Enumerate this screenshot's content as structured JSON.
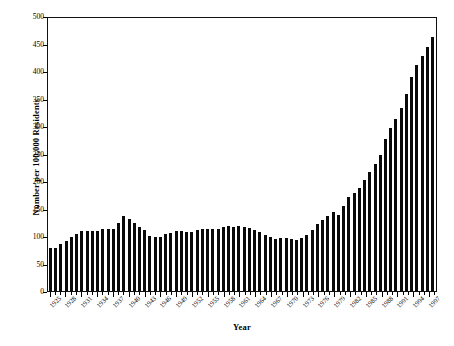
{
  "chart_data": {
    "type": "bar",
    "title": "",
    "xlabel": "Year",
    "ylabel": "Number per 100,000 Residents",
    "ylim": [
      0,
      500
    ],
    "ytick_step": 50,
    "yticks": [
      0,
      50,
      100,
      150,
      200,
      250,
      300,
      350,
      400,
      450,
      500
    ],
    "grid": false,
    "legend": "none",
    "bar_color": "#0a0a0a",
    "xtick_label_rotation": -45,
    "xtick_label_interval": 3,
    "xtick_labels": [
      "1925",
      "1928",
      "1931",
      "1934",
      "1937",
      "1940",
      "1943",
      "1946",
      "1949",
      "1952",
      "1955",
      "1958",
      "1961",
      "1964",
      "1967",
      "1970",
      "1973",
      "1976",
      "1979",
      "1982",
      "1985",
      "1988",
      "1991",
      "1994",
      "1997"
    ],
    "categories": [
      "1925",
      "1926",
      "1927",
      "1928",
      "1929",
      "1930",
      "1931",
      "1932",
      "1933",
      "1934",
      "1935",
      "1936",
      "1937",
      "1938",
      "1939",
      "1940",
      "1941",
      "1942",
      "1943",
      "1944",
      "1945",
      "1946",
      "1947",
      "1948",
      "1949",
      "1950",
      "1951",
      "1952",
      "1953",
      "1954",
      "1955",
      "1956",
      "1957",
      "1958",
      "1959",
      "1960",
      "1961",
      "1962",
      "1963",
      "1964",
      "1965",
      "1966",
      "1967",
      "1968",
      "1969",
      "1970",
      "1971",
      "1972",
      "1973",
      "1974",
      "1975",
      "1976",
      "1977",
      "1978",
      "1979",
      "1980",
      "1981",
      "1982",
      "1983",
      "1984",
      "1985",
      "1986",
      "1987",
      "1988",
      "1989",
      "1990",
      "1991",
      "1992",
      "1993",
      "1994",
      "1995",
      "1996",
      "1997",
      "1998"
    ],
    "values": [
      79,
      79,
      85,
      91,
      98,
      104,
      110,
      110,
      109,
      109,
      113,
      113,
      113,
      123,
      137,
      131,
      124,
      117,
      111,
      100,
      98,
      99,
      103,
      106,
      109,
      109,
      107,
      107,
      111,
      112,
      112,
      112,
      113,
      117,
      119,
      117,
      119,
      117,
      114,
      111,
      108,
      102,
      98,
      94,
      97,
      96,
      95,
      93,
      96,
      102,
      111,
      121,
      129,
      137,
      143,
      139,
      154,
      171,
      179,
      188,
      202,
      217,
      231,
      247,
      276,
      297,
      313,
      332,
      359,
      389,
      411,
      427,
      444,
      461
    ]
  }
}
